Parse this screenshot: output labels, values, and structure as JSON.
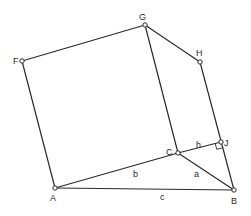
{
  "diagram": {
    "points": [
      {
        "id": "A",
        "label": "A",
        "x": 55,
        "y": 188,
        "lx": 50,
        "ly": 201
      },
      {
        "id": "B",
        "label": "B",
        "x": 234,
        "y": 190,
        "lx": 231,
        "ly": 204
      },
      {
        "id": "C",
        "label": "C",
        "x": 178,
        "y": 153,
        "lx": 166,
        "ly": 155
      },
      {
        "id": "F",
        "label": "F",
        "x": 22,
        "y": 61,
        "lx": 13,
        "ly": 64
      },
      {
        "id": "G",
        "label": "G",
        "x": 145,
        "y": 25,
        "lx": 139,
        "ly": 20
      },
      {
        "id": "H",
        "label": "H",
        "x": 200,
        "y": 62,
        "lx": 196,
        "ly": 56
      },
      {
        "id": "J",
        "label": "J",
        "x": 221,
        "y": 142,
        "lx": 224,
        "ly": 146
      }
    ],
    "edges": [
      [
        "A",
        "B"
      ],
      [
        "A",
        "C"
      ],
      [
        "C",
        "B"
      ],
      [
        "C",
        "J"
      ],
      [
        "A",
        "F"
      ],
      [
        "F",
        "G"
      ],
      [
        "G",
        "C"
      ],
      [
        "G",
        "H"
      ],
      [
        "H",
        "B"
      ]
    ],
    "side_labels": [
      {
        "text": "b",
        "x": 133,
        "y": 177
      },
      {
        "text": "a",
        "x": 194,
        "y": 177
      },
      {
        "text": "c",
        "x": 160,
        "y": 200
      },
      {
        "text": "h",
        "x": 196,
        "y": 148
      }
    ],
    "right_angle_at": "J"
  }
}
